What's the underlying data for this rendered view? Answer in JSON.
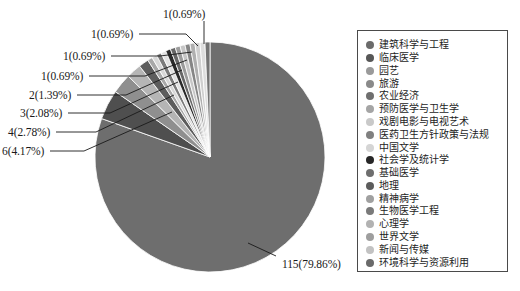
{
  "chart_data": {
    "type": "pie",
    "title": "",
    "total": 144,
    "categories": [
      "建筑科学与工程",
      "临床医学",
      "园艺",
      "旅游",
      "农业经济",
      "预防医学与卫生学",
      "戏剧电影与电视艺术",
      "医药卫生方针政策与法规",
      "中国文学",
      "社会学及统计学",
      "基础医学",
      "地理",
      "精神病学",
      "生物医学工程",
      "心理学",
      "世界文学",
      "新闻与传媒",
      "环境科学与资源利用"
    ],
    "values": [
      115,
      6,
      4,
      3,
      2,
      1,
      1,
      1,
      1,
      1,
      1,
      1,
      1,
      1,
      1,
      1,
      1,
      1
    ],
    "percents": [
      79.86,
      4.17,
      2.78,
      2.08,
      1.39,
      0.69,
      0.69,
      0.69,
      0.69,
      0.69,
      0.69,
      0.69,
      0.69,
      0.69,
      0.69,
      0.69,
      0.69,
      0.69
    ],
    "slice_colors": [
      "#6e6e6e",
      "#4f4f4f",
      "#8f8f8f",
      "#b5b5b5",
      "#5d5d5d",
      "#a8a8a8",
      "#d8d8d8",
      "#7b7b7b",
      "#e2e2e2",
      "#2a2a2a",
      "#676767",
      "#9b9b9b",
      "#c6c6c6",
      "#868686",
      "#b0b0b0",
      "#cfcfcf",
      "#dedede",
      "#747474"
    ],
    "labels": [
      {
        "text": "115(79.86%)",
        "x": 282,
        "y": 258
      },
      {
        "text": "1(0.69%)",
        "x": 163,
        "y": 8
      },
      {
        "text": "1(0.69%)",
        "x": 91,
        "y": 28
      },
      {
        "text": "1(0.69%)",
        "x": 63,
        "y": 50
      },
      {
        "text": "1(0.69%)",
        "x": 41,
        "y": 70
      },
      {
        "text": "2(1.39%)",
        "x": 29,
        "y": 89
      },
      {
        "text": "3(2.08%)",
        "x": 20,
        "y": 107
      },
      {
        "text": "4(2.78%)",
        "x": 8,
        "y": 126
      },
      {
        "text": "6(4.17%)",
        "x": 2,
        "y": 145
      }
    ],
    "legend_colors": [
      "#6b6b6b",
      "#575757",
      "#9a9a9a",
      "#8a8a8a",
      "#6f6f6f",
      "#a5a5a5",
      "#c9c9c9",
      "#808080",
      "#d5d5d5",
      "#272727",
      "#6e6e6e",
      "#5c5c5c",
      "#a0a0a0",
      "#7a7a7a",
      "#b2b2b2",
      "#9e9e9e",
      "#c2c2c2",
      "#6a6a6a"
    ],
    "geometry": {
      "cx": 210,
      "cy": 157,
      "r": 115,
      "start_angle_deg": -90
    },
    "legend_position": "right",
    "grid": false,
    "xlabel": "",
    "ylabel": ""
  }
}
